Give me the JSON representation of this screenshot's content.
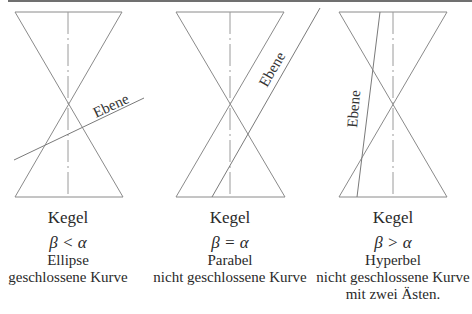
{
  "figure": {
    "panels": [
      {
        "id": "ellipse",
        "cone_label": "Kegel",
        "plane_label": "Ebene",
        "condition": "β < α",
        "curve_type": "Ellipse",
        "description_lines": [
          "geschlossene Kurve"
        ]
      },
      {
        "id": "parabola",
        "cone_label": "Kegel",
        "plane_label": "Ebene",
        "condition": "β = α",
        "curve_type": "Parabel",
        "description_lines": [
          "nicht geschlossene Kurve"
        ]
      },
      {
        "id": "hyperbola",
        "cone_label": "Kegel",
        "plane_label": "Ebene",
        "condition": "β > α",
        "curve_type": "Hyperbel",
        "description_lines": [
          "nicht geschlossene Kurve",
          "mit zwei Ästen."
        ]
      }
    ],
    "colors": {
      "lines": "#8a8a8a",
      "text": "#2a2a2a",
      "background": "#ffffff"
    }
  }
}
